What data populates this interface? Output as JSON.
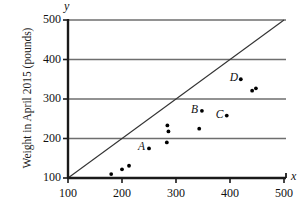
{
  "chart_data": {
    "type": "scatter",
    "title": "",
    "xlabel": "x",
    "ylabel": "Weight in April 2015 (pounds)",
    "xlim": [
      100,
      500
    ],
    "ylim": [
      100,
      500
    ],
    "xticks": [
      100,
      200,
      300,
      400,
      500
    ],
    "yticks": [
      100,
      200,
      300,
      400,
      500
    ],
    "xtick_labels": [
      "100",
      "200",
      "300",
      "400",
      "500"
    ],
    "ytick_labels": [
      "100",
      "200",
      "300",
      "400",
      "500"
    ],
    "grid": "horizontal",
    "legend": "none",
    "reference_line": {
      "name": "y = x identity line",
      "from": [
        100,
        100
      ],
      "to": [
        500,
        500
      ]
    },
    "points": [
      {
        "x": 180,
        "y": 110,
        "label": ""
      },
      {
        "x": 200,
        "y": 122,
        "label": ""
      },
      {
        "x": 213,
        "y": 131,
        "label": ""
      },
      {
        "x": 250,
        "y": 175,
        "label": "A"
      },
      {
        "x": 283,
        "y": 190,
        "label": ""
      },
      {
        "x": 286,
        "y": 218,
        "label": ""
      },
      {
        "x": 284,
        "y": 233,
        "label": ""
      },
      {
        "x": 343,
        "y": 225,
        "label": ""
      },
      {
        "x": 348,
        "y": 270,
        "label": "B"
      },
      {
        "x": 394,
        "y": 258,
        "label": "C"
      },
      {
        "x": 420,
        "y": 350,
        "label": "D"
      },
      {
        "x": 441,
        "y": 321,
        "label": ""
      },
      {
        "x": 448,
        "y": 327,
        "label": ""
      }
    ],
    "point_labels": [
      {
        "text": "A",
        "x": 250,
        "y": 175
      },
      {
        "text": "B",
        "x": 348,
        "y": 270
      },
      {
        "text": "C",
        "x": 394,
        "y": 258
      },
      {
        "text": "D",
        "x": 420,
        "y": 350
      }
    ],
    "colors": {
      "axis": "#1a1a1a",
      "grid": "#6e6e6e",
      "point": "#000000",
      "reference_line": "#333333",
      "background": "#ffffff"
    }
  },
  "axes": {
    "x_axis_name": "x",
    "y_axis_name": "y"
  }
}
